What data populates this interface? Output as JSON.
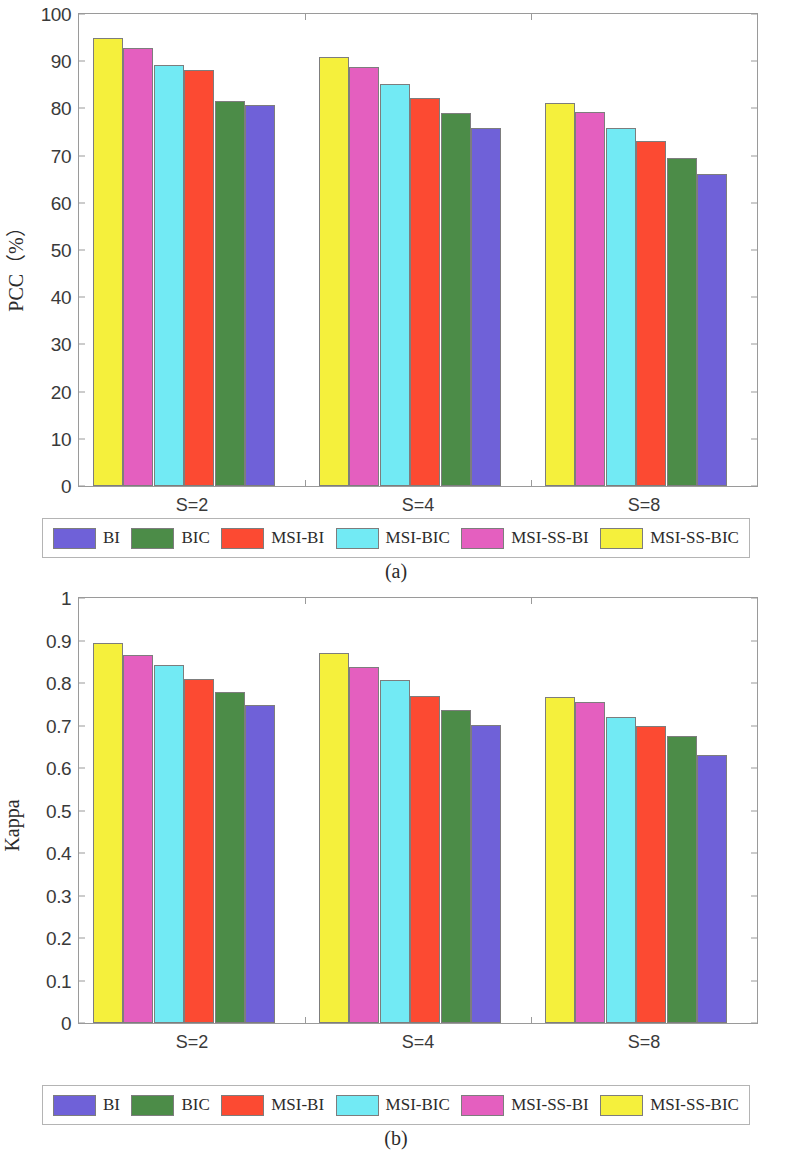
{
  "figure": {
    "panels": [
      {
        "id": "a",
        "caption": "(a)",
        "ylabel": "PCC（%）",
        "ytick_labels": [
          "100",
          "90",
          "80",
          "70",
          "60",
          "50",
          "40",
          "30",
          "20",
          "10",
          "0"
        ]
      },
      {
        "id": "b",
        "caption": "(b)",
        "ylabel": "Kappa",
        "ytick_labels": [
          "1",
          "0.9",
          "0.8",
          "0.7",
          "0.6",
          "0.5",
          "0.4",
          "0.3",
          "0.2",
          "0.1",
          "0"
        ]
      }
    ],
    "legend": {
      "entries": [
        {
          "label": "BI",
          "color": "#6f61d8"
        },
        {
          "label": "BIC",
          "color": "#4c8c48"
        },
        {
          "label": "MSI-BI",
          "color": "#fc4a32"
        },
        {
          "label": "MSI-BIC",
          "color": "#72eaf4"
        },
        {
          "label": "MSI-SS-BI",
          "color": "#e45fbf"
        },
        {
          "label": "MSI-SS-BIC",
          "color": "#f5f03c"
        }
      ]
    }
  },
  "chart_data": [
    {
      "type": "bar",
      "panel": "a",
      "title": "",
      "xlabel": "",
      "ylabel": "PCC（%）",
      "ylim": [
        0,
        100
      ],
      "yticks": [
        0,
        10,
        20,
        30,
        40,
        50,
        60,
        70,
        80,
        90,
        100
      ],
      "grid": false,
      "legend_position": "below-axes",
      "categories": [
        "S=2",
        "S=4",
        "S=8"
      ],
      "series": [
        {
          "name": "MSI-SS-BIC",
          "color": "#f5f03c",
          "values": [
            95.0,
            90.8,
            81.1
          ]
        },
        {
          "name": "MSI-SS-BI",
          "color": "#e45fbf",
          "values": [
            92.9,
            88.8,
            79.3
          ]
        },
        {
          "name": "MSI-BIC",
          "color": "#72eaf4",
          "values": [
            89.2,
            85.1,
            75.8
          ]
        },
        {
          "name": "MSI-BI",
          "color": "#fc4a32",
          "values": [
            88.2,
            82.2,
            73.2
          ]
        },
        {
          "name": "BIC",
          "color": "#4c8c48",
          "values": [
            81.5,
            79.0,
            69.6
          ]
        },
        {
          "name": "BI",
          "color": "#6f61d8",
          "values": [
            80.7,
            75.9,
            66.1
          ]
        }
      ]
    },
    {
      "type": "bar",
      "panel": "b",
      "title": "",
      "xlabel": "",
      "ylabel": "Kappa",
      "ylim": [
        0,
        1
      ],
      "yticks": [
        0,
        0.1,
        0.2,
        0.3,
        0.4,
        0.5,
        0.6,
        0.7,
        0.8,
        0.9,
        1
      ],
      "grid": false,
      "legend_position": "below-axes",
      "categories": [
        "S=2",
        "S=4",
        "S=8"
      ],
      "series": [
        {
          "name": "MSI-SS-BIC",
          "color": "#f5f03c",
          "values": [
            0.895,
            0.87,
            0.767
          ]
        },
        {
          "name": "MSI-SS-BI",
          "color": "#e45fbf",
          "values": [
            0.866,
            0.838,
            0.755
          ]
        },
        {
          "name": "MSI-BIC",
          "color": "#72eaf4",
          "values": [
            0.842,
            0.808,
            0.72
          ]
        },
        {
          "name": "MSI-BI",
          "color": "#fc4a32",
          "values": [
            0.81,
            0.77,
            0.699
          ]
        },
        {
          "name": "BIC",
          "color": "#4c8c48",
          "values": [
            0.778,
            0.737,
            0.675
          ]
        },
        {
          "name": "BI",
          "color": "#6f61d8",
          "values": [
            0.749,
            0.702,
            0.63
          ]
        }
      ]
    }
  ]
}
